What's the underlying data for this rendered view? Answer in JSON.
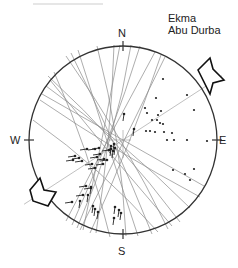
{
  "title": {
    "line1": "Ekma",
    "line2": "Abu Durba"
  },
  "compass": {
    "north": "N",
    "east": "E",
    "south": "S",
    "west": "W"
  },
  "colors": {
    "primitive": "#333333",
    "great_circles": "#8a8a8a",
    "axis": "#b0b0b0",
    "points": "#222222",
    "arrow_stroke": "#111111",
    "arrow_fill": "#ffffff"
  },
  "stereonet": {
    "center": [
      123,
      140
    ],
    "radius": 94,
    "compression_axis_azimuth": 57,
    "arrows": [
      "NE compression arrow",
      "SW compression arrow"
    ]
  },
  "poles_east": [
    [
      163,
      79
    ],
    [
      156,
      98
    ],
    [
      187,
      95
    ],
    [
      194,
      110
    ],
    [
      145,
      108
    ],
    [
      147,
      113
    ],
    [
      161,
      111
    ],
    [
      158,
      115
    ],
    [
      157,
      120
    ],
    [
      160,
      123
    ],
    [
      163,
      124
    ],
    [
      152,
      120
    ],
    [
      155,
      132
    ],
    [
      146,
      131
    ],
    [
      150,
      131
    ],
    [
      164,
      132
    ],
    [
      172,
      133
    ],
    [
      167,
      140
    ],
    [
      174,
      140
    ],
    [
      187,
      140
    ],
    [
      207,
      141
    ],
    [
      173,
      170
    ],
    [
      185,
      174
    ],
    [
      194,
      169
    ],
    [
      190,
      180
    ]
  ],
  "lineations_west": [
    [
      84,
      149,
      -1
    ],
    [
      92,
      149,
      -1
    ],
    [
      96,
      148,
      -1
    ],
    [
      106,
      150,
      -1
    ],
    [
      110,
      149,
      1
    ],
    [
      113,
      147,
      1
    ],
    [
      114,
      151,
      1
    ],
    [
      110,
      152,
      1
    ],
    [
      112,
      154,
      1
    ],
    [
      97,
      154,
      -1
    ],
    [
      94,
      157,
      -1
    ],
    [
      101,
      159,
      -1
    ],
    [
      72,
      156,
      -1
    ],
    [
      76,
      158,
      -1
    ],
    [
      70,
      160,
      -1
    ],
    [
      79,
      161,
      -1
    ],
    [
      89,
      164,
      -1
    ],
    [
      92,
      168,
      -1
    ],
    [
      100,
      164,
      -1
    ],
    [
      104,
      160,
      -1
    ],
    [
      83,
      186,
      -1
    ],
    [
      88,
      188,
      -1
    ],
    [
      80,
      195,
      -1
    ],
    [
      90,
      190,
      1
    ],
    [
      87,
      198,
      1
    ],
    [
      92,
      209,
      1
    ],
    [
      79,
      204,
      1
    ],
    [
      69,
      202,
      -1
    ],
    [
      114,
      210,
      1
    ],
    [
      118,
      213,
      1
    ],
    [
      120,
      216,
      1
    ],
    [
      113,
      221,
      1
    ],
    [
      97,
      215,
      1
    ],
    [
      94,
      212,
      1
    ],
    [
      133,
      132,
      1
    ],
    [
      123,
      117,
      1
    ]
  ],
  "great_circles": [
    {
      "a": [
        66,
        56
      ],
      "b": [
        168,
        229
      ]
    },
    {
      "a": [
        71,
        53
      ],
      "b": [
        152,
        234
      ]
    },
    {
      "a": [
        78,
        50
      ],
      "b": [
        138,
        236
      ]
    },
    {
      "a": [
        97,
        46
      ],
      "b": [
        126,
        236
      ]
    },
    {
      "a": [
        114,
        45
      ],
      "b": [
        96,
        233
      ]
    },
    {
      "a": [
        120,
        45
      ],
      "b": [
        83,
        230
      ]
    },
    {
      "a": [
        131,
        45
      ],
      "b": [
        77,
        228
      ]
    },
    {
      "a": [
        140,
        46
      ],
      "b": [
        72,
        225
      ]
    },
    {
      "a": [
        155,
        52
      ],
      "b": [
        66,
        221
      ]
    },
    {
      "a": [
        161,
        55
      ],
      "b": [
        90,
        233
      ]
    },
    {
      "a": [
        165,
        57
      ],
      "b": [
        80,
        230
      ]
    },
    {
      "a": [
        50,
        80
      ],
      "b": [
        172,
        226
      ]
    },
    {
      "a": [
        46,
        86
      ],
      "b": [
        190,
        208
      ]
    },
    {
      "a": [
        42,
        94
      ],
      "b": [
        204,
        186
      ]
    },
    {
      "a": [
        40,
        100
      ],
      "b": [
        200,
        197
      ]
    },
    {
      "a": [
        48,
        76
      ],
      "b": [
        180,
        222
      ]
    },
    {
      "a": [
        33,
        120
      ],
      "b": [
        158,
        232
      ]
    },
    {
      "a": [
        54,
        72
      ],
      "b": [
        110,
        237
      ]
    }
  ]
}
